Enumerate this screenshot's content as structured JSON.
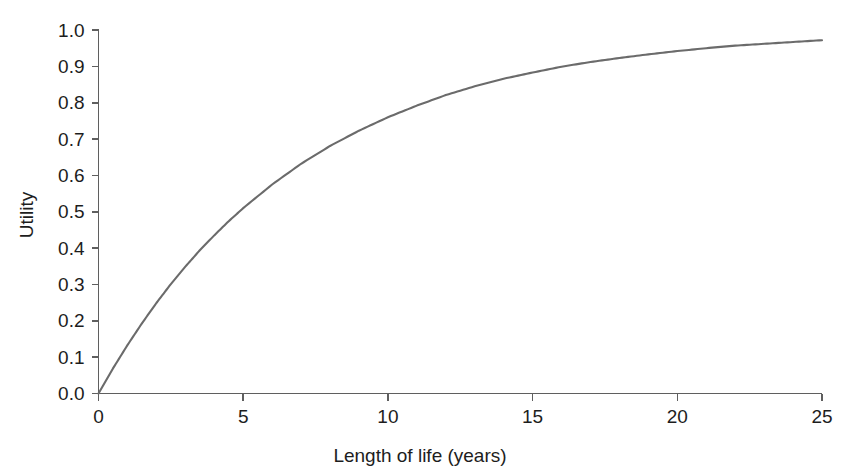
{
  "chart_data": {
    "type": "line",
    "title": "",
    "subtitle": "",
    "xlabel": "Length of life (years)",
    "ylabel": "Utility",
    "xlim": [
      0,
      25
    ],
    "ylim": [
      0,
      1.0
    ],
    "grid": false,
    "legend": false,
    "legend_position": "none",
    "annotations": [],
    "xticks": [
      0,
      5,
      10,
      15,
      20,
      25
    ],
    "xtick_labels": [
      "0",
      "5",
      "10",
      "15",
      "20",
      "25"
    ],
    "yticks": [
      0.0,
      0.1,
      0.2,
      0.3,
      0.4,
      0.5,
      0.6,
      0.7,
      0.8,
      0.9,
      1.0
    ],
    "ytick_labels": [
      "0.0",
      "0.1",
      "0.2",
      "0.3",
      "0.4",
      "0.5",
      "0.6",
      "0.7",
      "0.8",
      "0.9",
      "1.0"
    ],
    "curve_color": "#6b6b6b",
    "axis_color": "#5f5f5f",
    "background_color": "#ffffff",
    "series": [
      {
        "name": "Utility of length of life",
        "formula": "u = 1 - exp(-x / 7)",
        "x": [
          0,
          0.5,
          1,
          1.5,
          2,
          2.5,
          3,
          3.5,
          4,
          4.5,
          5,
          6,
          7,
          8,
          9,
          10,
          11,
          12,
          13,
          14,
          15,
          16,
          17,
          18,
          19,
          20,
          21,
          22,
          23,
          24,
          25
        ],
        "values": [
          0.0,
          0.069,
          0.133,
          0.193,
          0.249,
          0.301,
          0.349,
          0.394,
          0.435,
          0.474,
          0.51,
          0.575,
          0.632,
          0.681,
          0.723,
          0.76,
          0.792,
          0.821,
          0.845,
          0.866,
          0.883,
          0.899,
          0.912,
          0.923,
          0.933,
          0.942,
          0.95,
          0.957,
          0.962,
          0.967,
          0.972
        ]
      }
    ]
  },
  "axes": {
    "y_title": "Utility",
    "x_title": "Length of life (years)"
  }
}
